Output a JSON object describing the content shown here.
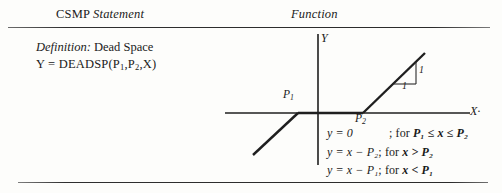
{
  "page": {
    "background_color": "#fdfdfb",
    "ink_color": "#1a1a1a"
  },
  "headers": {
    "left_roman": "CSMP",
    "left_italic": "Statement",
    "right": "Function"
  },
  "definition": {
    "label": "Definition:",
    "name": "Dead Space",
    "formula_lhs": "Y",
    "formula_eq": "=",
    "formula_rhs_pre": "DEADSP(P",
    "formula_sub1": "1",
    "formula_comma1": ",P",
    "formula_sub2": "2",
    "formula_tail": ",X)"
  },
  "graph": {
    "axis_label_y": "Y",
    "axis_label_x": "X",
    "point_label_p1": "P",
    "point_label_p1_sub": "1",
    "point_label_p2": "P",
    "point_label_p2_sub": "2",
    "slope_rise_label": "1",
    "slope_run_label": "1",
    "line_color": "#1f1f1f"
  },
  "equations": [
    {
      "lhs": "y = 0",
      "cond_semicolon": "; for ",
      "cond": "P₁ ≤ x ≤ P₂"
    },
    {
      "lhs": "y = x − P₂",
      "cond_semicolon": "; for ",
      "cond": "x > P₂"
    },
    {
      "lhs": "y = x − P₁",
      "cond_semicolon": "; for ",
      "cond": "x < P₁"
    }
  ]
}
